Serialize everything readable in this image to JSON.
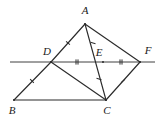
{
  "figure": {
    "type": "geometry-diagram",
    "background_color": "#ffffff",
    "stroke_color": "#2b2b2b",
    "label_color": "#1a1a1a",
    "canvas": {
      "width": 165,
      "height": 124
    },
    "points": [
      {
        "id": "A",
        "label": "A",
        "x": 85,
        "y": 24,
        "label_x": 85,
        "label_y": 14
      },
      {
        "id": "B",
        "label": "B",
        "x": 14,
        "y": 100,
        "label_x": 12,
        "label_y": 114
      },
      {
        "id": "C",
        "label": "C",
        "x": 106,
        "y": 100,
        "label_x": 107,
        "label_y": 114
      },
      {
        "id": "D",
        "label": "D",
        "x": 51,
        "y": 62,
        "label_x": 47,
        "label_y": 55
      },
      {
        "id": "E",
        "label": "E",
        "x": 103,
        "y": 62,
        "label_x": 99,
        "label_y": 56
      },
      {
        "id": "F",
        "label": "F",
        "x": 140,
        "y": 62,
        "label_x": 148,
        "label_y": 54
      }
    ],
    "segments": [
      {
        "id": "AD",
        "from": "A",
        "to": "D",
        "x1": 85,
        "y1": 24,
        "x2": 51,
        "y2": 62
      },
      {
        "id": "DB",
        "from": "D",
        "to": "B",
        "x1": 51,
        "y1": 62,
        "x2": 14,
        "y2": 100
      },
      {
        "id": "BC",
        "from": "B",
        "to": "C",
        "x1": 14,
        "y1": 100,
        "x2": 106,
        "y2": 100
      },
      {
        "id": "DC",
        "from": "D",
        "to": "C",
        "x1": 51,
        "y1": 62,
        "x2": 106,
        "y2": 100
      },
      {
        "id": "AC",
        "from": "A",
        "to": "C",
        "x1": 85,
        "y1": 24,
        "x2": 106,
        "y2": 100
      },
      {
        "id": "AF",
        "from": "A",
        "to": "F",
        "x1": 85,
        "y1": 24,
        "x2": 140,
        "y2": 62
      },
      {
        "id": "CF",
        "from": "C",
        "to": "F",
        "x1": 106,
        "y1": 100,
        "x2": 140,
        "y2": 62
      }
    ],
    "baseline": {
      "id": "DEF-line",
      "x1": 10,
      "y1": 62,
      "x2": 155,
      "y2": 62
    },
    "tick_marks": [
      {
        "id": "tick-AD",
        "on": "AD",
        "count": 1,
        "x": 68,
        "y": 43,
        "angle": -48
      },
      {
        "id": "tick-DB",
        "on": "DB",
        "count": 1,
        "x": 32,
        "y": 81,
        "angle": -46
      },
      {
        "id": "tick-AE",
        "on": "AC",
        "count": 1,
        "x": 93,
        "y": 43,
        "angle": -75
      },
      {
        "id": "tick-EC",
        "on": "AC",
        "count": 1,
        "x": 99,
        "y": 79,
        "angle": -75
      },
      {
        "id": "tick-CF",
        "on": "CF",
        "count": 1,
        "x": 123,
        "y": 81,
        "angle": 48
      },
      {
        "id": "tick-DE",
        "on": "DE",
        "count": 2,
        "x": 77,
        "y": 62,
        "angle": 0
      },
      {
        "id": "tick-EF",
        "on": "EF",
        "count": 2,
        "x": 121,
        "y": 62,
        "angle": 0
      }
    ]
  }
}
